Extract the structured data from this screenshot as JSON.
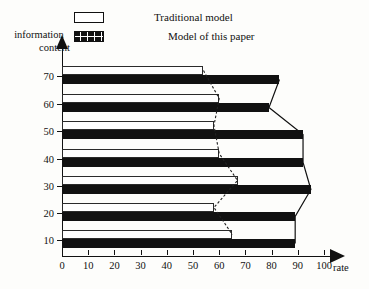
{
  "legend": {
    "items": [
      {
        "label": "Traditional model",
        "swatch": "open-rectangle-icon"
      },
      {
        "label": "Model of this paper",
        "swatch": "hatched-rectangle-icon"
      }
    ]
  },
  "axes": {
    "ytitle_line1": "information",
    "ytitle_line2": "content",
    "xtitle": "rate"
  },
  "chart_data": {
    "type": "bar",
    "orientation": "horizontal",
    "title": "",
    "xlabel": "rate",
    "ylabel": "information content",
    "categories": [
      "10",
      "20",
      "30",
      "40",
      "50",
      "60",
      "70"
    ],
    "xlim": [
      0,
      110
    ],
    "ylim": [
      0,
      75
    ],
    "xticks": [
      0,
      10,
      20,
      30,
      40,
      50,
      60,
      70,
      80,
      90,
      100
    ],
    "yticks": [
      10,
      20,
      30,
      40,
      50,
      60,
      70
    ],
    "grid": false,
    "legend_position": "top",
    "series": [
      {
        "name": "Traditional model",
        "color": "#ffffff",
        "edgecolor": "#2a2a2a",
        "values": [
          65,
          58,
          67,
          60,
          58,
          60,
          54
        ]
      },
      {
        "name": "Model of this paper",
        "color": "#111111",
        "values": [
          89,
          89,
          95,
          92,
          92,
          79,
          83
        ]
      }
    ]
  }
}
